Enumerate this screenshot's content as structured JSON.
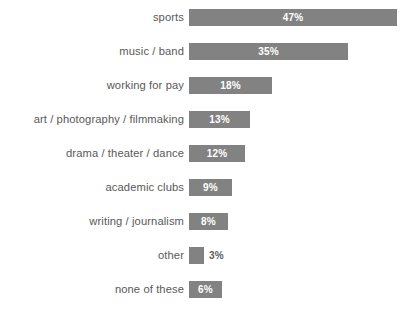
{
  "chart_data": {
    "type": "bar",
    "orientation": "horizontal",
    "title": "",
    "subtitle": "",
    "xlabel": "",
    "ylabel": "",
    "grid": false,
    "legend": null,
    "axis_visible": false,
    "value_suffix": "%",
    "xlim": [
      0,
      47
    ],
    "background_color": "#ffffff",
    "bar_color": "#828282",
    "label_color": "#595959",
    "value_label_inside_color": "#ffffff",
    "value_label_outside_color": "#5e5e5e",
    "categories": [
      "sports",
      "music / band",
      "working for pay",
      "art / photography / filmmaking",
      "drama / theater / dance",
      "academic clubs",
      "writing / journalism",
      "other",
      "none of these"
    ],
    "values": [
      47,
      35,
      18,
      13,
      12,
      9,
      8,
      3,
      6
    ],
    "value_labels": [
      "47%",
      "35%",
      "18%",
      "13%",
      "12%",
      "9%",
      "8%",
      "3%",
      "6%"
    ],
    "bars": [
      {
        "category": "sports",
        "value": 47,
        "value_label": "47%",
        "bar_width_px": 208,
        "label_placement": "inside"
      },
      {
        "category": "music / band",
        "value": 35,
        "value_label": "35%",
        "bar_width_px": 159,
        "label_placement": "inside"
      },
      {
        "category": "working for pay",
        "value": 18,
        "value_label": "18%",
        "bar_width_px": 83,
        "label_placement": "inside"
      },
      {
        "category": "art / photography / filmmaking",
        "value": 13,
        "value_label": "13%",
        "bar_width_px": 61,
        "label_placement": "inside"
      },
      {
        "category": "drama / theater / dance",
        "value": 12,
        "value_label": "12%",
        "bar_width_px": 56,
        "label_placement": "inside"
      },
      {
        "category": "academic clubs",
        "value": 9,
        "value_label": "9%",
        "bar_width_px": 43,
        "label_placement": "inside"
      },
      {
        "category": "writing / journalism",
        "value": 8,
        "value_label": "8%",
        "bar_width_px": 39,
        "label_placement": "inside"
      },
      {
        "category": "other",
        "value": 3,
        "value_label": "3%",
        "bar_width_px": 15,
        "label_placement": "outside"
      },
      {
        "category": "none of these",
        "value": 6,
        "value_label": "6%",
        "bar_width_px": 33,
        "label_placement": "inside"
      }
    ]
  }
}
